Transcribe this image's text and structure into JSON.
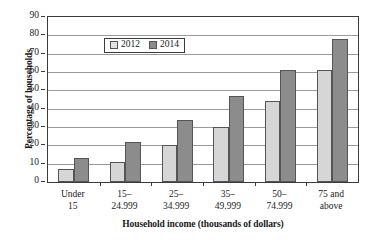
{
  "chart_data": {
    "type": "bar",
    "title": "",
    "xlabel": "Household income (thousands of dollars)",
    "ylabel": "Percentage of households",
    "categories": [
      "Under\n15",
      "15–\n24.999",
      "25–\n34.999",
      "35–\n49.999",
      "50–\n74.999",
      "75 and\nabove"
    ],
    "series": [
      {
        "name": "2012",
        "color": "#d6d6d6",
        "values": [
          7,
          11,
          20,
          30,
          44,
          61
        ]
      },
      {
        "name": "2014",
        "color": "#8c8c8c",
        "values": [
          13,
          22,
          34,
          47,
          61,
          78
        ]
      }
    ],
    "ylim": [
      0,
      90
    ],
    "ytick_step": 10,
    "yticks": [
      0,
      10,
      20,
      30,
      40,
      50,
      60,
      70,
      80,
      90
    ],
    "ytick_labels": [
      "0",
      "10",
      "20",
      "30",
      "40",
      "50",
      "60",
      "70",
      "80",
      "90"
    ],
    "grid": true,
    "grid_axis": "y",
    "legend_position": "top-left"
  }
}
